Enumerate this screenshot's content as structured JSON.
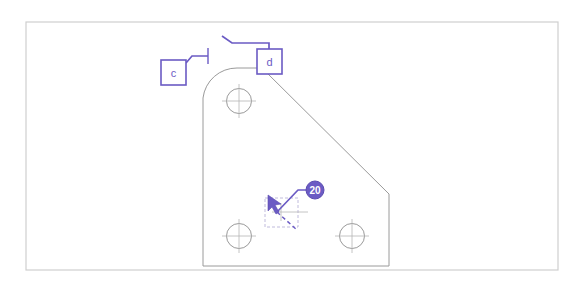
{
  "view": {
    "name": "cad-drawing-view",
    "background_color": "#ffffff",
    "width": 585,
    "height": 292
  },
  "sheet_frame": {
    "name": "sheet-border",
    "stroke_color": "#cfcfcf",
    "x": 26,
    "y": 22,
    "width": 532,
    "height": 248
  },
  "colors": {
    "annotation_purple": "#6b5bc4",
    "annotation_purple_dark": "#5a4bb0",
    "geometry_gray": "#9a9a9a",
    "centerline_gray": "#b5b5b5",
    "frame_gray": "#cfcfcf",
    "badge_fill": "#6b5bc4",
    "badge_text": "#ffffff",
    "label_box_fill": "#ffffff"
  },
  "part": {
    "name": "bracket-plate-outline",
    "description": "gusset bracket plate profile",
    "stroke_color": "#9a9a9a",
    "path": "M 203 266 L 203 98 A 34 34 0 0 1 237 68 L 262 68 L 389 194 L 389 266 Z",
    "bounds": {
      "x": 203,
      "y": 68,
      "width": 186,
      "height": 198
    }
  },
  "holes": [
    {
      "name": "hole-top-left",
      "cx": 239,
      "cy": 101,
      "r": 12.5,
      "tick": 17
    },
    {
      "name": "hole-bottom-left",
      "cx": 239,
      "cy": 236,
      "r": 12.5,
      "tick": 17
    },
    {
      "name": "hole-bottom-right",
      "cx": 352,
      "cy": 236,
      "r": 12.5,
      "tick": 17
    }
  ],
  "annotations": {
    "label_c": {
      "name": "annotation-label-c",
      "text": "c",
      "box": {
        "x": 161,
        "y": 60,
        "width": 25,
        "height": 25
      },
      "leader": "M 186 63 L 192 56 L 208 56",
      "tick": "M 208 48 L 208 64"
    },
    "label_d": {
      "name": "annotation-label-d",
      "text": "d",
      "box": {
        "x": 257,
        "y": 49,
        "width": 25,
        "height": 25
      },
      "leader": "M 269 49 L 269 43 L 232 43 L 222 36",
      "tick": ""
    },
    "callout_20": {
      "name": "callout-badge-20",
      "text": "20",
      "cx": 315,
      "cy": 190,
      "r": 9,
      "leader": "M 306 190 L 298 190 L 277 212",
      "arrow_tip": {
        "x": 277,
        "y": 212
      }
    }
  },
  "selection": {
    "name": "selection-box",
    "stroke_color": "#b9b3d8",
    "x": 265,
    "y": 198,
    "width": 33,
    "height": 29,
    "crosshair_cx": 281,
    "crosshair_cy": 212,
    "crosshair_len": 18,
    "dash": "3 2"
  },
  "dimension_dash": {
    "name": "dimension-dashed-leader",
    "path": "M 277 212 L 297 230",
    "dash": "4 3",
    "stroke_color": "#6b5bc4"
  },
  "cursor": {
    "name": "mouse-cursor-arrow",
    "x": 268,
    "y": 195,
    "fill": "#6b5bc4",
    "points": "268,195 268,211 272,207 276,214 279,212 275,205 281,204"
  }
}
